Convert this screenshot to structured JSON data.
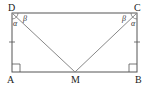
{
  "diagram": {
    "title": "",
    "points": {
      "D": {
        "label": "D",
        "x": 12,
        "y": 13
      },
      "C": {
        "label": "C",
        "x": 137,
        "y": 13
      },
      "A": {
        "label": "A",
        "x": 12,
        "y": 72
      },
      "B": {
        "label": "B",
        "x": 137,
        "y": 72
      },
      "M": {
        "label": "M",
        "x": 75,
        "y": 72
      }
    },
    "segments": [
      "DC",
      "CB",
      "BA",
      "AD",
      "DM",
      "CM"
    ],
    "angles": {
      "D_alpha": "α",
      "D_beta": "β",
      "C_alpha": "α",
      "C_beta": "β"
    },
    "right_angles": [
      "A",
      "B"
    ],
    "equal_ticks": [
      "AD",
      "BC"
    ],
    "colors": {
      "stroke": "#555555",
      "diag": "#888888",
      "text": "#222222"
    }
  }
}
